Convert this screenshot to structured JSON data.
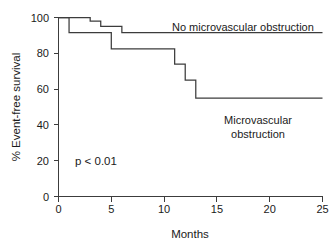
{
  "chart_data": {
    "type": "line",
    "title": "",
    "xlabel": "Months",
    "ylabel": "% Event-free survival",
    "xlim": [
      0,
      25
    ],
    "ylim": [
      0,
      100
    ],
    "xticks": [
      0,
      5,
      10,
      15,
      20,
      25
    ],
    "yticks": [
      0,
      20,
      40,
      60,
      80,
      100
    ],
    "xtick_labels": [
      "0",
      "5",
      "10",
      "15",
      "20",
      "25"
    ],
    "ytick_labels": [
      "0",
      "20",
      "40",
      "60",
      "80",
      "100"
    ],
    "grid": false,
    "legend_position": "inline-annotations",
    "line_color": "#3c3c3c",
    "background_color": "#ffffff",
    "series": [
      {
        "name": "No microvascular obstruction",
        "label_text": "No microvascular obstruction",
        "step_type": "post",
        "x": [
          0,
          3,
          3,
          4,
          4,
          6,
          6,
          25
        ],
        "y": [
          100,
          100,
          98,
          98,
          95,
          95,
          91.5,
          91.5
        ],
        "points": [
          {
            "x": 0,
            "y": 100
          },
          {
            "x": 3,
            "y": 98
          },
          {
            "x": 4,
            "y": 95
          },
          {
            "x": 6,
            "y": 91.5
          },
          {
            "x": 25,
            "y": 91.5
          }
        ]
      },
      {
        "name": "Microvascular obstruction",
        "label_text_line1": "Microvascular",
        "label_text_line2": "obstruction",
        "step_type": "post",
        "x": [
          0,
          1,
          1,
          5,
          5,
          11,
          11,
          12,
          12,
          13,
          13,
          25
        ],
        "y": [
          100,
          100,
          91.5,
          91.5,
          82.5,
          82.5,
          74,
          74,
          65,
          65,
          55,
          55
        ],
        "points": [
          {
            "x": 0,
            "y": 100
          },
          {
            "x": 1,
            "y": 91.5
          },
          {
            "x": 5,
            "y": 82.5
          },
          {
            "x": 11,
            "y": 74
          },
          {
            "x": 12,
            "y": 65
          },
          {
            "x": 13,
            "y": 55
          },
          {
            "x": 25,
            "y": 55
          }
        ]
      }
    ],
    "annotations": [
      {
        "name": "p-value",
        "text": "p < 0.01",
        "x": 3.2,
        "y": 22
      }
    ]
  }
}
